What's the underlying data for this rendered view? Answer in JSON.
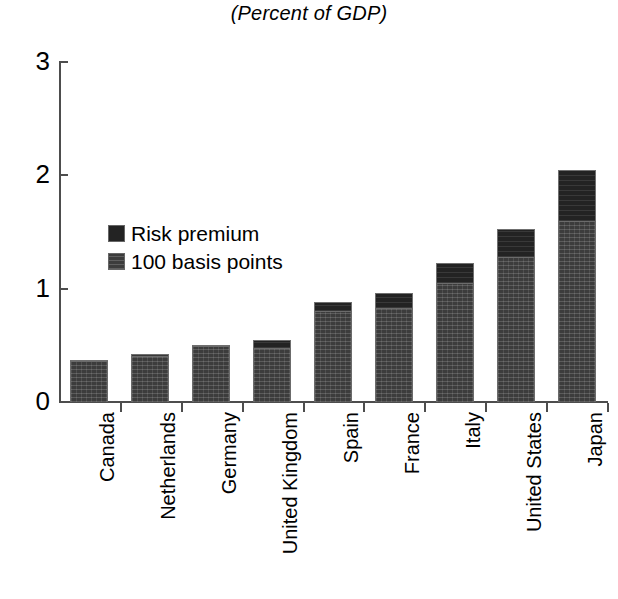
{
  "chart_data": {
    "type": "bar",
    "subtype": "stacked-bar",
    "title": "(Percent of GDP)",
    "xlabel": "",
    "ylabel": "",
    "ylim": [
      0,
      3
    ],
    "yticks": [
      0,
      1,
      2,
      3
    ],
    "ytick_labels": [
      "0",
      "1",
      "2",
      "3"
    ],
    "grid": false,
    "legend_position": "inside-upper-left",
    "categories": [
      "Canada",
      "Netherlands",
      "Germany",
      "United Kingdom",
      "Spain",
      "France",
      "Italy",
      "United States",
      "Japan"
    ],
    "series": [
      {
        "name": "100 basis points",
        "color": "#3c3c3c",
        "values": [
          0.36,
          0.41,
          0.49,
          0.48,
          0.8,
          0.83,
          1.05,
          1.28,
          1.6
        ]
      },
      {
        "name": "Risk premium",
        "color": "#232323",
        "values": [
          0.01,
          0.01,
          0.01,
          0.07,
          0.08,
          0.13,
          0.18,
          0.25,
          0.45
        ]
      }
    ],
    "totals": [
      0.37,
      0.42,
      0.5,
      0.55,
      0.88,
      0.96,
      1.23,
      1.53,
      2.05
    ]
  },
  "title": {
    "text": "(Percent of GDP)"
  },
  "legend": {
    "items": [
      {
        "label": "Risk premium",
        "swatch": "risk-premium-swatch"
      },
      {
        "label": "100 basis points",
        "swatch": "basis-points-swatch"
      }
    ]
  },
  "axis": {
    "y_tick_labels": [
      "3",
      "2",
      "1",
      "0"
    ]
  },
  "colors": {
    "risk_premium": "#232323",
    "basis_points": "#3c3c3c",
    "axis": "#4d4d4d",
    "background": "#ffffff",
    "text": "#000000"
  }
}
